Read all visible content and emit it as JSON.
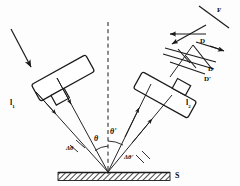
{
  "figure": {
    "type": "optics-ray-diagram",
    "width": 240,
    "height": 186,
    "background": "#fdfdfd",
    "stroke_color": "#1a1a1a"
  },
  "labels": {
    "collimator_left": "l",
    "collimator_left_sub": "1",
    "collimator_right": "l",
    "collimator_right_sub": "2",
    "angle_theta": "θ",
    "angle_theta_prime": "θ'",
    "angle_delta_theta": "Δθ",
    "angle_delta_theta_prime": "Δθ'",
    "sample": "S",
    "detector_f": "F",
    "detector_d_upper": "D",
    "detector_d": "D",
    "detector_d_prime": "D'"
  },
  "elements": {
    "incident_beam": "incident-beam-arrow",
    "normal_line": "surface-normal-dashed-line",
    "sample_surface": "hatched-sample-surface",
    "left_collimator_body": "left-collimator-rectangle",
    "right_collimator_body": "right-collimator-rectangle",
    "detector_grating": "parallel-beam-grating-lines",
    "scattered_rays_left": "incident-convergent-rays",
    "scattered_rays_right": "reflected-divergent-rays"
  },
  "geometry": {
    "sample_point_x": 108,
    "sample_point_y": 173,
    "normal_top_y": 22,
    "normal_bottom_y": 174,
    "surface_left_x": 58,
    "surface_right_x": 170,
    "surface_top_y": 172,
    "surface_thickness": 8,
    "theta_degrees": 30,
    "theta_prime_degrees": 28
  }
}
